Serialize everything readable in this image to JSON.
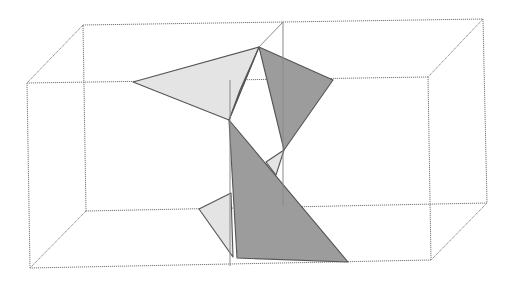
{
  "diagram": {
    "title": "",
    "colors": {
      "background": "#ffffff",
      "box_edge": "#7a7a7a",
      "light_fill": "#e4e4e4",
      "dark_fill": "#9c9c9c",
      "polygon_stroke": "#555555"
    },
    "box": {
      "back_top_left": [
        83,
        25
      ],
      "back_top_right": [
        483,
        19
      ],
      "back_bottom_left": [
        86,
        211
      ],
      "back_bottom_right": [
        487,
        203
      ],
      "front_top_left": [
        27,
        83
      ],
      "front_top_right": [
        428,
        77
      ],
      "front_bottom_left": [
        30,
        268
      ],
      "front_bottom_right": [
        431,
        260
      ]
    },
    "inner_lines": [
      {
        "name": "inner-vertical-left",
        "points": [
          [
            230,
            80
          ],
          [
            230,
            266
          ]
        ]
      },
      {
        "name": "inner-vertical-right",
        "points": [
          [
            283,
            22
          ],
          [
            283,
            206
          ]
        ]
      },
      {
        "name": "inner-diagonal-top",
        "points": [
          [
            259,
            47
          ],
          [
            283,
            22
          ]
        ]
      }
    ],
    "polygons": [
      {
        "name": "light-triangle-upper-left",
        "fill": "light",
        "points": [
          [
            133,
            82
          ],
          [
            259,
            47
          ],
          [
            229,
            120
          ]
        ]
      },
      {
        "name": "light-sliver-upper",
        "fill": "light",
        "points": [
          [
            259,
            47
          ],
          [
            240,
            90
          ],
          [
            229,
            120
          ]
        ]
      },
      {
        "name": "dark-triangle-upper-right",
        "fill": "dark",
        "points": [
          [
            259,
            47
          ],
          [
            333,
            80
          ],
          [
            284,
            150
          ]
        ]
      },
      {
        "name": "dark-triangle-large-lower",
        "fill": "dark",
        "points": [
          [
            229,
            120
          ],
          [
            348,
            262
          ],
          [
            237,
            258
          ]
        ]
      },
      {
        "name": "light-triangle-small-middle",
        "fill": "light",
        "points": [
          [
            266,
            162
          ],
          [
            284,
            150
          ],
          [
            276,
            175
          ]
        ]
      },
      {
        "name": "light-triangle-lower-left",
        "fill": "light",
        "points": [
          [
            199,
            209
          ],
          [
            231,
            193
          ],
          [
            233,
            257
          ]
        ]
      }
    ]
  }
}
